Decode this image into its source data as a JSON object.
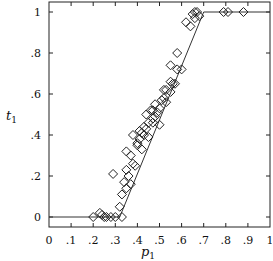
{
  "chart_data": {
    "type": "scatter",
    "title": "",
    "xlabel": "p1",
    "ylabel": "t1",
    "xlim": [
      0,
      1
    ],
    "ylim": [
      0,
      1
    ],
    "grid": false,
    "legend": null,
    "x_ticks": [
      0,
      0.1,
      0.2,
      0.3,
      0.4,
      0.5,
      0.6,
      0.7,
      0.8,
      0.9,
      1
    ],
    "x_tick_labels": [
      "0",
      ".1",
      ".2",
      ".3",
      ".4",
      ".5",
      ".6",
      ".7",
      ".8",
      ".9",
      "1"
    ],
    "y_ticks": [
      0,
      0.2,
      0.4,
      0.6,
      0.8,
      1
    ],
    "y_tick_labels": [
      "0",
      ".2",
      ".4",
      ".6",
      ".8",
      "1"
    ],
    "series": [
      {
        "name": "observations",
        "marker": "diamond-open",
        "points": [
          [
            0.2,
            0.0
          ],
          [
            0.23,
            0.02
          ],
          [
            0.24,
            0.01
          ],
          [
            0.25,
            0.0
          ],
          [
            0.26,
            0.0
          ],
          [
            0.28,
            0.0
          ],
          [
            0.3,
            0.0
          ],
          [
            0.29,
            0.21
          ],
          [
            0.32,
            0.05
          ],
          [
            0.33,
            0.0
          ],
          [
            0.34,
            0.17
          ],
          [
            0.35,
            0.14
          ],
          [
            0.35,
            0.23
          ],
          [
            0.36,
            0.2
          ],
          [
            0.37,
            0.16
          ],
          [
            0.35,
            0.32
          ],
          [
            0.37,
            0.3
          ],
          [
            0.38,
            0.26
          ],
          [
            0.38,
            0.4
          ],
          [
            0.39,
            0.25
          ],
          [
            0.4,
            0.36
          ],
          [
            0.4,
            0.35
          ],
          [
            0.41,
            0.38
          ],
          [
            0.41,
            0.42
          ],
          [
            0.42,
            0.33
          ],
          [
            0.42,
            0.41
          ],
          [
            0.43,
            0.44
          ],
          [
            0.43,
            0.4
          ],
          [
            0.44,
            0.5
          ],
          [
            0.45,
            0.46
          ],
          [
            0.45,
            0.39
          ],
          [
            0.46,
            0.52
          ],
          [
            0.47,
            0.48
          ],
          [
            0.47,
            0.46
          ],
          [
            0.48,
            0.49
          ],
          [
            0.48,
            0.55
          ],
          [
            0.49,
            0.51
          ],
          [
            0.5,
            0.53
          ],
          [
            0.5,
            0.45
          ],
          [
            0.51,
            0.57
          ],
          [
            0.52,
            0.58
          ],
          [
            0.53,
            0.62
          ],
          [
            0.53,
            0.56
          ],
          [
            0.55,
            0.61
          ],
          [
            0.55,
            0.66
          ],
          [
            0.56,
            0.65
          ],
          [
            0.57,
            0.65
          ],
          [
            0.58,
            0.72
          ],
          [
            0.58,
            0.8
          ],
          [
            0.55,
            0.74
          ],
          [
            0.6,
            0.72
          ],
          [
            0.62,
            0.95
          ],
          [
            0.64,
            0.93
          ],
          [
            0.65,
            0.99
          ],
          [
            0.66,
            0.97
          ],
          [
            0.66,
            1.0
          ],
          [
            0.67,
            1.0
          ],
          [
            0.68,
            0.98
          ],
          [
            0.79,
            1.0
          ],
          [
            0.81,
            1.0
          ],
          [
            0.88,
            1.0
          ],
          [
            0.47,
            0.52
          ],
          [
            0.44,
            0.43
          ],
          [
            0.52,
            0.62
          ],
          [
            0.33,
            0.11
          ]
        ]
      },
      {
        "name": "fitted-line",
        "type": "line",
        "points": [
          [
            0,
            0
          ],
          [
            0.32,
            0
          ],
          [
            0.7,
            1
          ],
          [
            1,
            1
          ]
        ]
      }
    ]
  }
}
